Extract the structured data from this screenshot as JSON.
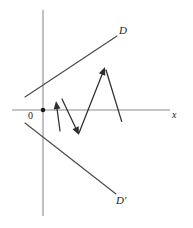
{
  "figure": {
    "kind": "geometry-diagram",
    "background_color": "#ffffff",
    "axis_color": "#8c8c8c",
    "ray_color": "#4a4a4a",
    "vector_color": "#2e2e2e",
    "labels": {
      "line_d": "D",
      "line_d_prime": "D'",
      "x_axis": "x",
      "origin": "0"
    }
  },
  "chart_data": {
    "type": "scatter",
    "title": "",
    "xlabel": "x",
    "ylabel": "",
    "grid": false,
    "legend": null,
    "axes": {
      "x_axis": {
        "x1": 12,
        "y1": 110,
        "x2": 170,
        "y2": 110
      },
      "y_axis": {
        "x1": 43,
        "y1": 10,
        "x2": 43,
        "y2": 216
      },
      "origin": {
        "x": 43,
        "y": 110
      }
    },
    "lines": [
      {
        "name": "D",
        "label": "D",
        "label_pos": {
          "x": 119,
          "y": 25
        },
        "x1": 25,
        "y1": 97,
        "x2": 117,
        "y2": 36
      },
      {
        "name": "D-prime",
        "label": "D'",
        "label_pos": {
          "x": 116,
          "y": 195
        },
        "x1": 25,
        "y1": 123,
        "x2": 116,
        "y2": 194
      }
    ],
    "vectors": [
      {
        "name": "v1",
        "x1": 60,
        "y1": 131,
        "x2": 56,
        "y2": 101
      },
      {
        "name": "v2",
        "x1": 62,
        "y1": 99,
        "x2": 79,
        "y2": 135
      },
      {
        "name": "v3",
        "x1": 79,
        "y1": 133,
        "x2": 105,
        "y2": 67
      },
      {
        "name": "v4",
        "x1": 106,
        "y1": 70,
        "x2": 124,
        "y2": 129
      }
    ]
  }
}
